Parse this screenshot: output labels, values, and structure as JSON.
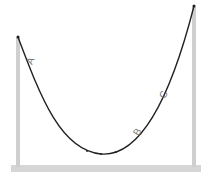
{
  "diagram": {
    "labels": {
      "a": "A",
      "b": "B",
      "c": "C"
    },
    "colors": {
      "pole": "#cfcfcf",
      "base": "#d6d6d6",
      "rope": "#222222",
      "label": "#777777"
    }
  }
}
